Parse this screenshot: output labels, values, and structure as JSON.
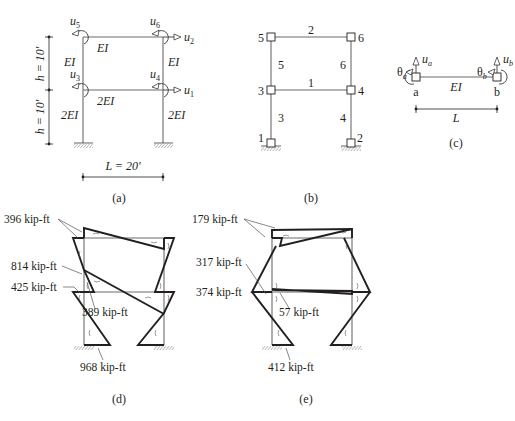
{
  "panel_a": {
    "caption": "(a)",
    "dofs": {
      "u1": "u",
      "u1_sub": "1",
      "u2": "u",
      "u2_sub": "2",
      "u3": "u",
      "u3_sub": "3",
      "u4": "u",
      "u4_sub": "4",
      "u5": "u",
      "u5_sub": "5",
      "u6": "u",
      "u6_sub": "6"
    },
    "stiffness": {
      "top_beam": "EI",
      "bottom_beam": "2EI",
      "upper_left_col": "EI",
      "upper_right_col": "EI",
      "lower_left_col": "2EI",
      "lower_right_col": "2EI"
    },
    "dimensions": {
      "h_upper": "h = 10′",
      "h_lower": "h = 10′",
      "span": "L = 20′"
    }
  },
  "panel_b": {
    "caption": "(b)",
    "nodes": [
      "1",
      "2",
      "3",
      "4",
      "5",
      "6"
    ],
    "elements": [
      "1",
      "2",
      "3",
      "4",
      "5",
      "6"
    ]
  },
  "panel_c": {
    "caption": "(c)",
    "theta_a": "θ",
    "theta_a_sub": "a",
    "theta_b": "θ",
    "theta_b_sub": "b",
    "u_a": "u",
    "u_a_sub": "a",
    "u_b": "u",
    "u_b_sub": "b",
    "node_a": "a",
    "node_b": "b",
    "stiffness": "EI",
    "span": "L"
  },
  "panel_d": {
    "caption": "(d)",
    "labels": [
      "396 kip-ft",
      "814 kip-ft",
      "425 kip-ft",
      "389 kip-ft",
      "968 kip-ft"
    ]
  },
  "panel_e": {
    "caption": "(e)",
    "labels": [
      "179 kip-ft",
      "317 kip-ft",
      "374 kip-ft",
      "57 kip-ft",
      "412 kip-ft"
    ]
  },
  "colors": {
    "ink": "#231f20",
    "frame": "#6d6b6b",
    "background": "#ffffff"
  }
}
